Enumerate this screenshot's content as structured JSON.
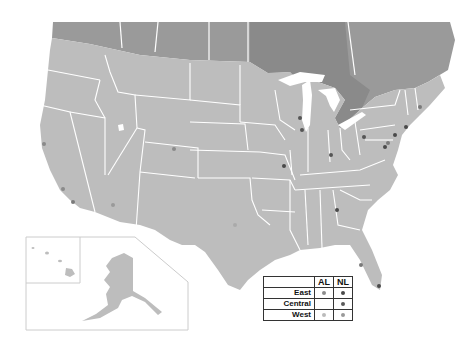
{
  "colors": {
    "background": "#ffffff",
    "us_fill": "#bdbdbd",
    "canada_fill": "#9a9a9a",
    "ontario_fill": "#8a8a8a",
    "borders": "#ffffff",
    "inset_border": "#cccccc",
    "al_east": "#8c8c8c",
    "nl_east": "#4a4a4a",
    "nl_central": "#5a5a5a",
    "al_west": "#aaaaaa",
    "nl_west": "#9a9a9a"
  },
  "legend": {
    "columns": [
      "AL",
      "NL"
    ],
    "rows": [
      {
        "label": "East",
        "al": "dot",
        "nl": "dot"
      },
      {
        "label": "Central",
        "al": "",
        "nl": "dot"
      },
      {
        "label": "West",
        "al": "dot",
        "nl": "dot"
      }
    ]
  },
  "markers": [
    {
      "x": 44,
      "y": 144,
      "shade": "#8a8a8a"
    },
    {
      "x": 63,
      "y": 189,
      "shade": "#8a8a8a"
    },
    {
      "x": 73,
      "y": 202,
      "shade": "#7a7a7a"
    },
    {
      "x": 113,
      "y": 205,
      "shade": "#9a9a9a"
    },
    {
      "x": 174,
      "y": 149,
      "shade": "#8a8a8a"
    },
    {
      "x": 235,
      "y": 225,
      "shade": "#aaaaaa"
    },
    {
      "x": 284,
      "y": 166,
      "shade": "#4a4a4a"
    },
    {
      "x": 300,
      "y": 118,
      "shade": "#555555"
    },
    {
      "x": 302,
      "y": 130,
      "shade": "#555555"
    },
    {
      "x": 331,
      "y": 155,
      "shade": "#555555"
    },
    {
      "x": 337,
      "y": 210,
      "shade": "#4a4a4a"
    },
    {
      "x": 364,
      "y": 137,
      "shade": "#555555"
    },
    {
      "x": 385,
      "y": 147,
      "shade": "#4a4a4a"
    },
    {
      "x": 388,
      "y": 143,
      "shade": "#7a7a7a"
    },
    {
      "x": 395,
      "y": 135,
      "shade": "#4a4a4a"
    },
    {
      "x": 406,
      "y": 127,
      "shade": "#4a4a4a"
    },
    {
      "x": 420,
      "y": 107,
      "shade": "#7a7a7a"
    },
    {
      "x": 361,
      "y": 265,
      "shade": "#7a7a7a"
    },
    {
      "x": 379,
      "y": 286,
      "shade": "#4a4a4a"
    }
  ]
}
